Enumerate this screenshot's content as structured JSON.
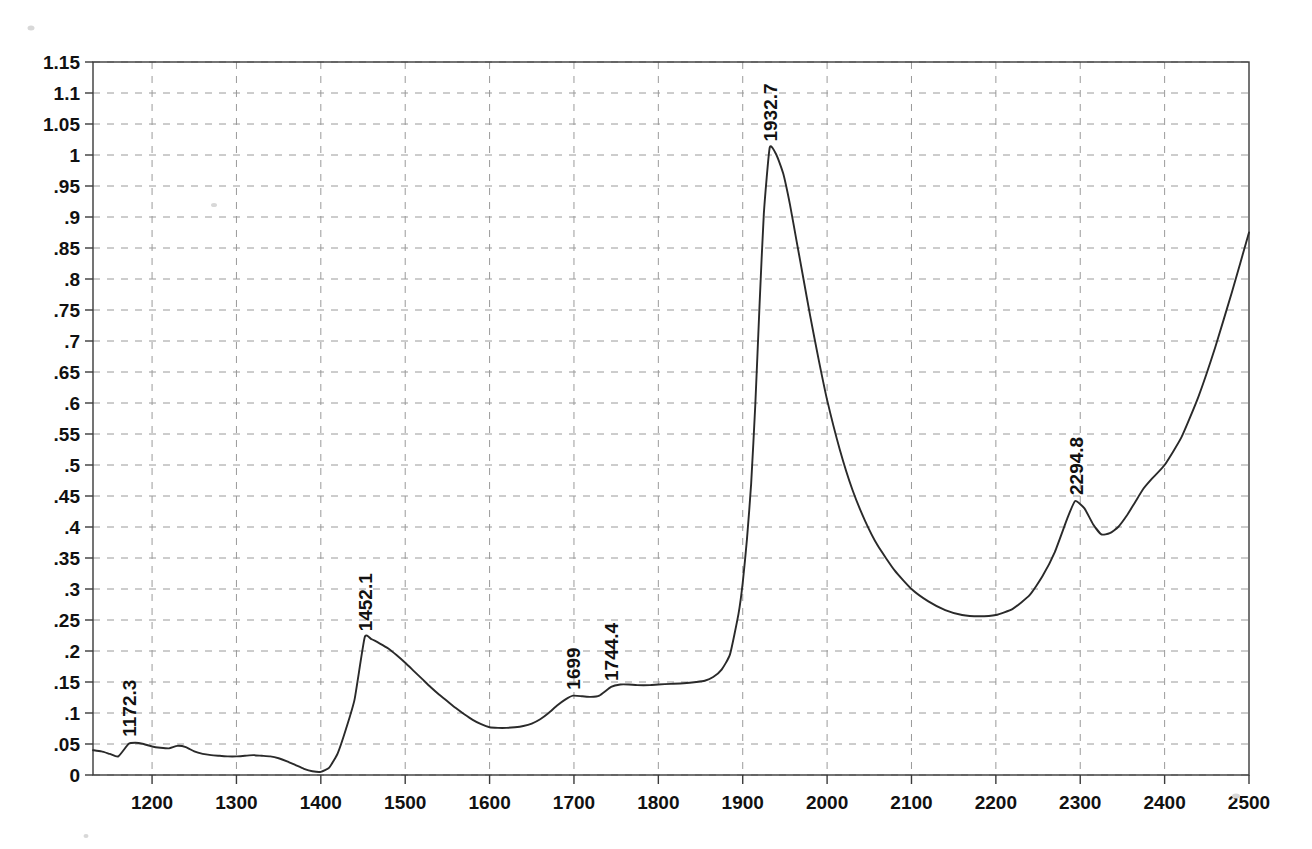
{
  "chart_data": {
    "type": "line",
    "title": "",
    "subtitle": "",
    "xlabel": "",
    "ylabel": "",
    "xlim": [
      1130,
      2500
    ],
    "ylim": [
      0,
      1.15
    ],
    "grid": true,
    "legend": null,
    "legend_position": "none",
    "line_color": "#2a2a2a",
    "grid_color": "#9a9a9a",
    "axis_color": "#3a3a3a",
    "xticks": [
      1200,
      1300,
      1400,
      1500,
      1600,
      1700,
      1800,
      1900,
      2000,
      2100,
      2200,
      2300,
      2400,
      2500
    ],
    "xtick_labels": [
      "1200",
      "1300",
      "1400",
      "1500",
      "1600",
      "1700",
      "1800",
      "1900",
      "2000",
      "2100",
      "2200",
      "2300",
      "2400",
      "2500"
    ],
    "yticks": [
      0,
      0.05,
      0.1,
      0.15,
      0.2,
      0.25,
      0.3,
      0.35,
      0.4,
      0.45,
      0.5,
      0.55,
      0.6,
      0.65,
      0.7,
      0.75,
      0.8,
      0.85,
      0.9,
      0.95,
      1.0,
      1.05,
      1.1,
      1.15
    ],
    "ytick_labels": [
      "0",
      ".05",
      ".1",
      ".15",
      ".2",
      ".25",
      ".3",
      ".35",
      ".4",
      ".45",
      ".5",
      ".55",
      ".6",
      ".65",
      ".7",
      ".75",
      ".8",
      ".85",
      ".9",
      ".95",
      "1",
      "1.05",
      "1.1",
      "1.15"
    ],
    "annotations": [
      {
        "label": "1172.3",
        "x": 1172.3,
        "y": 0.052,
        "rotation": -90
      },
      {
        "label": "1452.1",
        "x": 1452.1,
        "y": 0.222,
        "rotation": -90
      },
      {
        "label": "1699",
        "x": 1699.0,
        "y": 0.128,
        "rotation": -90
      },
      {
        "label": "1744.4",
        "x": 1744.4,
        "y": 0.142,
        "rotation": -90
      },
      {
        "label": "1932.7",
        "x": 1932.7,
        "y": 1.012,
        "rotation": -90
      },
      {
        "label": "2294.8",
        "x": 2294.8,
        "y": 0.442,
        "rotation": -90
      }
    ],
    "series": [
      {
        "name": "absorbance",
        "x": [
          1130,
          1140,
          1150,
          1160,
          1172,
          1180,
          1190,
          1200,
          1210,
          1220,
          1230,
          1240,
          1250,
          1260,
          1270,
          1280,
          1290,
          1300,
          1310,
          1320,
          1330,
          1340,
          1350,
          1360,
          1370,
          1380,
          1390,
          1400,
          1410,
          1420,
          1430,
          1440,
          1452,
          1460,
          1470,
          1480,
          1490,
          1500,
          1510,
          1520,
          1530,
          1540,
          1550,
          1560,
          1570,
          1580,
          1590,
          1600,
          1610,
          1620,
          1630,
          1640,
          1650,
          1660,
          1670,
          1680,
          1690,
          1699,
          1710,
          1720,
          1730,
          1744,
          1755,
          1765,
          1775,
          1790,
          1800,
          1815,
          1830,
          1845,
          1855,
          1865,
          1875,
          1885,
          1895,
          1900,
          1905,
          1910,
          1915,
          1920,
          1925,
          1932,
          1940,
          1948,
          1956,
          1964,
          1972,
          1980,
          1990,
          2000,
          2015,
          2030,
          2045,
          2060,
          2080,
          2100,
          2120,
          2140,
          2160,
          2180,
          2200,
          2220,
          2240,
          2255,
          2270,
          2285,
          2294,
          2305,
          2315,
          2325,
          2335,
          2345,
          2355,
          2365,
          2375,
          2385,
          2400,
          2420,
          2440,
          2460,
          2480,
          2500
        ],
        "y": [
          0.04,
          0.038,
          0.034,
          0.03,
          0.05,
          0.052,
          0.05,
          0.046,
          0.044,
          0.043,
          0.047,
          0.045,
          0.038,
          0.034,
          0.032,
          0.031,
          0.03,
          0.03,
          0.031,
          0.032,
          0.031,
          0.03,
          0.027,
          0.022,
          0.016,
          0.01,
          0.006,
          0.005,
          0.012,
          0.035,
          0.075,
          0.122,
          0.222,
          0.219,
          0.212,
          0.204,
          0.193,
          0.181,
          0.168,
          0.155,
          0.142,
          0.13,
          0.119,
          0.108,
          0.098,
          0.089,
          0.082,
          0.077,
          0.076,
          0.076,
          0.077,
          0.079,
          0.083,
          0.09,
          0.1,
          0.112,
          0.122,
          0.128,
          0.127,
          0.126,
          0.128,
          0.142,
          0.146,
          0.146,
          0.145,
          0.145,
          0.146,
          0.147,
          0.148,
          0.15,
          0.152,
          0.158,
          0.17,
          0.195,
          0.26,
          0.31,
          0.38,
          0.47,
          0.6,
          0.76,
          0.905,
          1.012,
          1.0,
          0.97,
          0.92,
          0.86,
          0.8,
          0.74,
          0.67,
          0.605,
          0.525,
          0.46,
          0.41,
          0.37,
          0.33,
          0.3,
          0.28,
          0.266,
          0.258,
          0.256,
          0.258,
          0.268,
          0.29,
          0.32,
          0.36,
          0.415,
          0.442,
          0.43,
          0.405,
          0.388,
          0.39,
          0.4,
          0.418,
          0.44,
          0.462,
          0.478,
          0.5,
          0.545,
          0.61,
          0.69,
          0.78,
          0.875
        ]
      }
    ]
  },
  "figure": {
    "plot_left": 93,
    "plot_top": 62,
    "plot_right": 1249,
    "plot_bottom": 775
  }
}
